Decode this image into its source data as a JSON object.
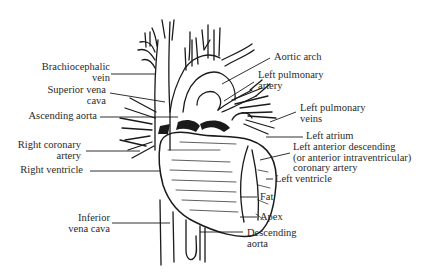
{
  "diagram": {
    "labels": {
      "brachiocephalic_vein": {
        "line1": "Brachiocephalic",
        "line2": "vein"
      },
      "superior_vena_cava": {
        "line1": "Superior vena",
        "line2": "cava"
      },
      "ascending_aorta": {
        "line1": "Ascending aorta"
      },
      "right_coronary_artery": {
        "line1": "Right coronary",
        "line2": "artery"
      },
      "right_ventricle": {
        "line1": "Right ventricle"
      },
      "inferior_vena_cava": {
        "line1": "Inferior",
        "line2": "vena cava"
      },
      "aortic_arch": {
        "line1": "Aortic arch"
      },
      "left_pulmonary_artery": {
        "line1": "Left pulmonary",
        "line2": "artery"
      },
      "left_pulmonary_veins": {
        "line1": "Left pulmonary",
        "line2": "veins"
      },
      "left_atrium": {
        "line1": "Left atrium"
      },
      "left_anterior_descending": {
        "line1": "Left anterior descending",
        "line2": "(or anterior intraventricular)",
        "line3": "coronary artery"
      },
      "left_ventricle": {
        "line1": "Left ventricle"
      },
      "fat": {
        "line1": "Fat"
      },
      "apex": {
        "line1": "Apex"
      },
      "descending_aorta": {
        "line1": "Descending",
        "line2": "aorta"
      }
    },
    "colors": {
      "ink": "#1a1a1a",
      "text": "#2a2a2a",
      "background": "#ffffff"
    }
  }
}
